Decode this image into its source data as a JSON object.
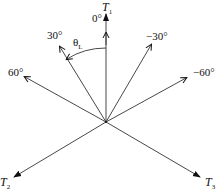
{
  "diagram": {
    "type": "vector-diagram",
    "center": [
      106,
      122
    ],
    "vectors": [
      {
        "name": "T1",
        "label": "T",
        "sub": "1",
        "angle_label": "0°",
        "tip": [
          106,
          13
        ]
      },
      {
        "name": "T2",
        "label": "T",
        "sub": "2",
        "tip": [
          13,
          178
        ]
      },
      {
        "name": "T3",
        "label": "T",
        "sub": "3",
        "tip": [
          201,
          178
        ]
      },
      {
        "name": "dir-30",
        "angle_label": "30°",
        "tip": [
          60,
          48
        ]
      },
      {
        "name": "dir-neg30",
        "angle_label": "−30°",
        "tip": [
          151,
          46
        ]
      },
      {
        "name": "dir-60",
        "angle_label": "60°",
        "tip": [
          25,
          77
        ]
      },
      {
        "name": "dir-neg60",
        "angle_label": "−60°",
        "tip": [
          186,
          79
        ]
      }
    ],
    "arc_label": {
      "symbol": "θ",
      "sub": "L"
    },
    "colors": {
      "line": "#333333",
      "text": "#111111"
    }
  }
}
